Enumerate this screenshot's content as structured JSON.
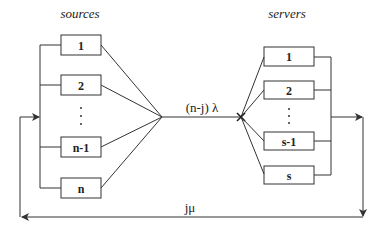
{
  "diagram": {
    "sources_title": "sources",
    "servers_title": "servers",
    "sources": [
      {
        "label": "1"
      },
      {
        "label": "2"
      },
      {
        "label": "n-1"
      },
      {
        "label": "n"
      }
    ],
    "servers": [
      {
        "label": "1"
      },
      {
        "label": "2"
      },
      {
        "label": "s-1"
      },
      {
        "label": "s"
      }
    ],
    "ellipsis": "⋮",
    "arrival_rate_label": "(n-j) λ",
    "return_rate_label": "jμ",
    "colors": {
      "line": "#333333",
      "background": "#ffffff"
    }
  }
}
